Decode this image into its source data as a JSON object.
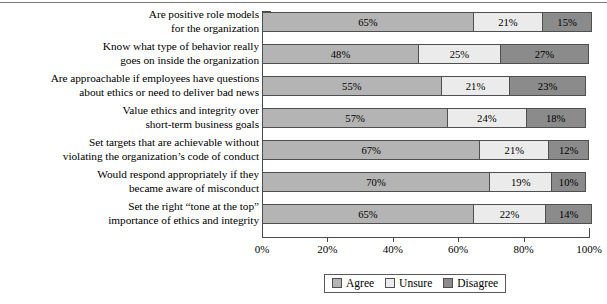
{
  "chart_data": {
    "type": "bar",
    "orientation": "horizontal",
    "stacked": true,
    "title": "",
    "xlabel": "",
    "ylabel": "",
    "xlim": [
      0,
      100
    ],
    "xticks": [
      "0%",
      "20%",
      "40%",
      "60%",
      "80%",
      "100%"
    ],
    "xtick_values": [
      0,
      20,
      40,
      60,
      80,
      100
    ],
    "grid": false,
    "legend_position": "bottom",
    "categories": [
      "Are positive role models for the organization",
      "Know what type of behavior really goes on inside the organization",
      "Are approachable if employees have questions about ethics or need to deliver bad news",
      "Value ethics and integrity over short-term business goals",
      "Set targets that are achievable without violating the organization’s code of conduct",
      "Would respond appropriately if they became aware of misconduct",
      "Set the right “tone at the top” importance of ethics and integrity"
    ],
    "category_lines": [
      [
        "Are positive role models",
        "for the organization"
      ],
      [
        "Know what type of behavior really",
        "goes on inside the organization"
      ],
      [
        "Are approachable if employees have questions",
        "about ethics or need to deliver bad news"
      ],
      [
        "Value ethics and integrity over",
        "short-term business goals"
      ],
      [
        "Set targets that are achievable without",
        "violating the organization’s code of conduct"
      ],
      [
        "Would respond appropriately if they",
        "became aware of misconduct"
      ],
      [
        "Set the right “tone at the top”",
        "importance of ethics and integrity"
      ]
    ],
    "series": [
      {
        "name": "Agree",
        "color": "#b4b4b4",
        "values": [
          65,
          48,
          55,
          57,
          67,
          70,
          65
        ],
        "labels": [
          "65%",
          "48%",
          "55%",
          "57%",
          "67%",
          "70%",
          "65%"
        ]
      },
      {
        "name": "Unsure",
        "color": "#ebebeb",
        "values": [
          21,
          25,
          21,
          24,
          21,
          19,
          22
        ],
        "labels": [
          "21%",
          "25%",
          "21%",
          "24%",
          "21%",
          "19%",
          "22%"
        ]
      },
      {
        "name": "Disagree",
        "color": "#8b8b8b",
        "values": [
          15,
          27,
          23,
          18,
          12,
          10,
          14
        ],
        "labels": [
          "15%",
          "27%",
          "23%",
          "18%",
          "12%",
          "10%",
          "14%"
        ]
      }
    ]
  },
  "legend": {
    "items": [
      {
        "label": "Agree",
        "swatch": "legend-swatch-agree"
      },
      {
        "label": "Unsure",
        "swatch": "legend-swatch-unsure"
      },
      {
        "label": "Disagree",
        "swatch": "legend-swatch-disagree"
      }
    ]
  }
}
